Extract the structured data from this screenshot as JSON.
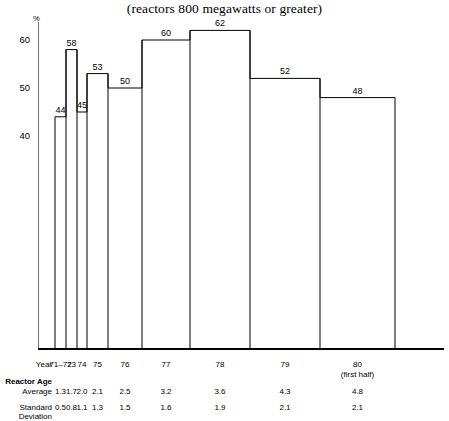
{
  "title": "(reactors 800 megawatts or greater)",
  "axis": {
    "y_unit": "%",
    "y_ticks": [
      "60",
      "50",
      "40"
    ],
    "y_tick_values": [
      60,
      50,
      40
    ],
    "year_row_label": "Year"
  },
  "table": {
    "section_label": "Reactor Age",
    "average_label": "Average",
    "stddev_label_line1": "Standard",
    "stddev_label_line2": "Deviation"
  },
  "chart_data": {
    "type": "bar",
    "title": "(reactors 800 megawatts or greater)",
    "xlabel": "Year",
    "ylabel": "%",
    "ylim": [
      32,
      66
    ],
    "grid": false,
    "legend": null,
    "categories": [
      "71-72",
      "73",
      "74",
      "75",
      "76",
      "77",
      "78",
      "79",
      "80"
    ],
    "category_labels": [
      "71–72",
      "73",
      "74",
      "75",
      "76",
      "77",
      "78",
      "79",
      "80"
    ],
    "category_sublabels": [
      "",
      "",
      "",
      "",
      "",
      "",
      "",
      "",
      "(first half)"
    ],
    "values": [
      44,
      58,
      45,
      53,
      50,
      60,
      62,
      52,
      48
    ],
    "value_labels": [
      "44",
      "58",
      "45",
      "53",
      "50",
      "60",
      "62",
      "52",
      "48"
    ],
    "bar_edges_px": [
      55,
      66,
      77,
      87,
      108,
      142,
      190,
      250,
      320,
      395,
      440
    ],
    "series": [
      {
        "name": "Reactor Age Average",
        "values": [
          1.3,
          1.7,
          2.0,
          2.1,
          2.5,
          3.2,
          3.6,
          4.3,
          4.8
        ],
        "value_labels": [
          "1.3",
          "1.7",
          "2.0",
          "2.1",
          "2.5",
          "3.2",
          "3.6",
          "4.3",
          "4.8"
        ]
      },
      {
        "name": "Reactor Age Standard Deviation",
        "values": [
          0.5,
          0.8,
          1.1,
          1.3,
          1.5,
          1.6,
          1.9,
          2.1,
          2.1
        ],
        "value_labels": [
          "0.5",
          "0.8",
          "1.1",
          "1.3",
          "1.5",
          "1.6",
          "1.9",
          "2.1",
          "2.1"
        ]
      }
    ]
  }
}
